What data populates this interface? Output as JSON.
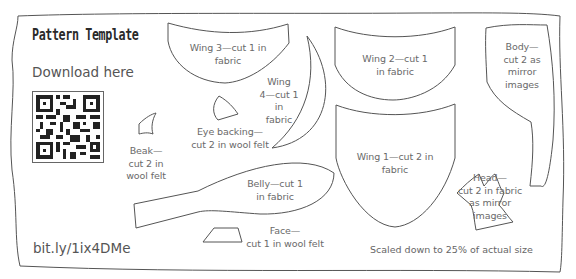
{
  "title": "Pattern Template",
  "download_text": "Download here",
  "qr_code": {
    "icon": "qr-code-icon"
  },
  "short_url": "bit.ly/1ix4DMe",
  "scale_note": "Scaled down to 25% of actual size",
  "pieces": [
    {
      "id": "wing3",
      "label_lines": [
        "Wing 3—cut 1 in",
        "fabric"
      ]
    },
    {
      "id": "wing4",
      "label_lines": [
        "Wing",
        "4—cut 1 in",
        "fabric"
      ]
    },
    {
      "id": "eye_backing",
      "label_lines": [
        "Eye backing—",
        "cut 2 in wool felt"
      ]
    },
    {
      "id": "beak",
      "label_lines": [
        "Beak—",
        "cut 2 in",
        "wool felt"
      ]
    },
    {
      "id": "belly",
      "label_lines": [
        "Belly—cut 1",
        "in fabric"
      ]
    },
    {
      "id": "face",
      "label_lines": [
        "Face—",
        "cut 1 in wool felt"
      ]
    },
    {
      "id": "wing2",
      "label_lines": [
        "Wing 2—cut 1",
        "in fabric"
      ]
    },
    {
      "id": "wing1",
      "label_lines": [
        "Wing 1—cut 2 in",
        "fabric"
      ]
    },
    {
      "id": "body",
      "label_lines": [
        "Body—",
        "cut 2 as",
        "mirror",
        "images"
      ]
    },
    {
      "id": "head",
      "label_lines": [
        "Head—",
        "cut 2 in fabric",
        "as mirror",
        "images"
      ]
    }
  ],
  "colors": {
    "outline": "#555555",
    "text": "#666666",
    "background": "#ffffff"
  }
}
